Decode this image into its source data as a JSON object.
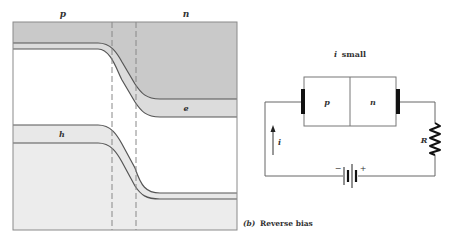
{
  "band_diagram": {
    "region_labels": {
      "p": "p",
      "n": "n"
    },
    "carrier_labels": {
      "electrons": "e",
      "holes": "h"
    },
    "colors": {
      "frame": "#8a8a8a",
      "band_line": "#555555",
      "conduction_fill_dark": "#c9c9c9",
      "conduction_band_strip": "#dcdcdc",
      "valence_fill_light": "#ececec",
      "valence_strip": "#e4e4e4",
      "dashed": "#888888"
    }
  },
  "circuit": {
    "title_prefix": "i",
    "title_suffix": "small",
    "diode_p_label": "p",
    "diode_n_label": "n",
    "current_label": "i",
    "resistor_label": "R",
    "battery_minus": "−",
    "battery_plus": "+"
  },
  "caption": {
    "index": "(b)",
    "text": "Reverse bias"
  }
}
